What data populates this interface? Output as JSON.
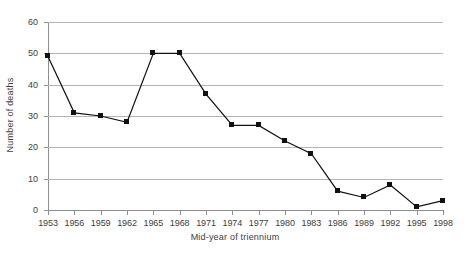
{
  "chart_data": {
    "type": "line",
    "title": "",
    "xlabel": "Mid-year of triennium",
    "ylabel": "Number of deaths",
    "categories": [
      "1953",
      "1956",
      "1959",
      "1962",
      "1965",
      "1968",
      "1971",
      "1974",
      "1977",
      "1980",
      "1983",
      "1986",
      "1989",
      "1992",
      "1995",
      "1998"
    ],
    "values": [
      49,
      31,
      30,
      28,
      50,
      50,
      37,
      27,
      27,
      22,
      18,
      6,
      4,
      8,
      1,
      3
    ],
    "ylim": [
      0,
      60
    ],
    "yticks": [
      0,
      10,
      20,
      30,
      40,
      50,
      60
    ],
    "grid": true,
    "legend": "none",
    "marker": "filled-square",
    "series_color": "#111111",
    "grid_color": "#b5b5b5",
    "axis_color": "#8f8f8f"
  }
}
